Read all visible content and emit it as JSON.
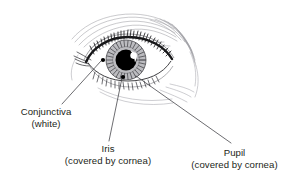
{
  "figure": {
    "background_color": "#ffffff",
    "ink_color": "#231f20",
    "sketch_color": "#8c8c92",
    "iris_color": "#b9b9bd",
    "pupil_color": "#000000",
    "highlight_color": "#ffffff"
  },
  "labels": {
    "conjunctiva": {
      "line1": "Conjunctiva",
      "line2": "(white)"
    },
    "iris": {
      "line1": "Iris",
      "line2": "(covered by cornea)"
    },
    "pupil": {
      "line1": "Pupil",
      "line2": "(covered by cornea)"
    }
  },
  "callouts": [
    {
      "name": "conjunctiva",
      "dot_x": 103,
      "dot_y": 60,
      "line_to_x": 62,
      "line_to_y": 104
    },
    {
      "name": "iris",
      "dot_x": 123,
      "dot_y": 77,
      "line_to_x": 108,
      "line_to_y": 142
    },
    {
      "name": "pupil",
      "dot_x": 135,
      "dot_y": 75,
      "line_to_x": 231,
      "line_to_y": 143
    }
  ],
  "anatomy": {
    "iris_center_x": 126,
    "iris_center_y": 60,
    "iris_radius": 20,
    "pupil_center_x": 126,
    "pupil_center_y": 60,
    "pupil_radius": 10.5
  }
}
